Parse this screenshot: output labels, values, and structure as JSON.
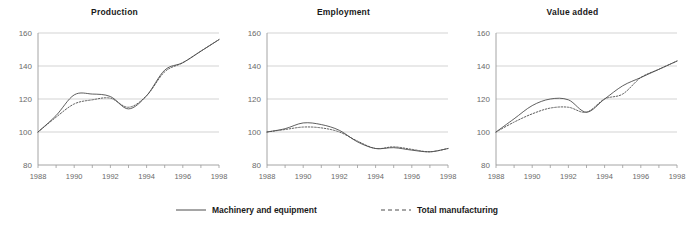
{
  "chart_data": [
    {
      "type": "line",
      "title": "Production",
      "xlabel": "",
      "ylabel": "",
      "x": [
        1988,
        1989,
        1990,
        1991,
        1992,
        1993,
        1994,
        1995,
        1996,
        1997,
        1998
      ],
      "xlim": [
        1988,
        1998
      ],
      "ylim": [
        80,
        160
      ],
      "yticks": [
        80,
        100,
        120,
        140,
        160
      ],
      "xticks": [
        1988,
        1990,
        1992,
        1994,
        1996,
        1998
      ],
      "grid": true,
      "legend_position": "bottom",
      "series": [
        {
          "name": "Machinery and equipment",
          "style": "solid",
          "values": [
            100,
            110,
            122.5,
            123,
            121.5,
            114,
            122,
            137.5,
            142,
            149,
            156
          ]
        },
        {
          "name": "Total manufacturing",
          "style": "dashed",
          "values": [
            100,
            109,
            117,
            119.5,
            120.5,
            115,
            122,
            136.5,
            142,
            149,
            156
          ]
        }
      ]
    },
    {
      "type": "line",
      "title": "Employment",
      "xlabel": "",
      "ylabel": "",
      "x": [
        1988,
        1989,
        1990,
        1991,
        1992,
        1993,
        1994,
        1995,
        1996,
        1997,
        1998
      ],
      "xlim": [
        1988,
        1998
      ],
      "ylim": [
        80,
        160
      ],
      "yticks": [
        80,
        100,
        120,
        140,
        160
      ],
      "xticks": [
        1988,
        1990,
        1992,
        1994,
        1996,
        1998
      ],
      "grid": true,
      "legend_position": "bottom",
      "series": [
        {
          "name": "Machinery and equipment",
          "style": "solid",
          "values": [
            100,
            102,
            105.5,
            104.5,
            101,
            94,
            90,
            90.5,
            89,
            88,
            90
          ]
        },
        {
          "name": "Total manufacturing",
          "style": "dashed",
          "values": [
            100,
            101.5,
            103,
            102.5,
            100,
            94.5,
            90,
            91,
            89.5,
            88,
            90
          ]
        }
      ]
    },
    {
      "type": "line",
      "title": "Value added",
      "xlabel": "",
      "ylabel": "",
      "x": [
        1988,
        1989,
        1990,
        1991,
        1992,
        1993,
        1994,
        1995,
        1996,
        1997,
        1998
      ],
      "xlim": [
        1988,
        1998
      ],
      "ylim": [
        80,
        160
      ],
      "yticks": [
        80,
        100,
        120,
        140,
        160
      ],
      "xticks": [
        1988,
        1990,
        1992,
        1994,
        1996,
        1998
      ],
      "grid": true,
      "legend_position": "bottom",
      "series": [
        {
          "name": "Machinery and equipment",
          "style": "solid",
          "values": [
            100,
            108,
            116,
            120,
            119.5,
            112,
            120,
            128,
            133,
            138,
            143
          ]
        },
        {
          "name": "Total manufacturing",
          "style": "dashed",
          "values": [
            100,
            106,
            111,
            114.5,
            115,
            112,
            120,
            123,
            133,
            138,
            143
          ]
        }
      ]
    }
  ],
  "panels": [
    {
      "title": "Production"
    },
    {
      "title": "Employment"
    },
    {
      "title": "Value added"
    }
  ],
  "legend": {
    "machinery": {
      "label": "Machinery and equipment",
      "style": "solid"
    },
    "total": {
      "label": "Total manufacturing",
      "style": "dashed"
    }
  },
  "colors": {
    "line": "#4d4d4d",
    "grid": "#c8c8c8",
    "axis": "#9a9a9a",
    "tick_text": "#6a6a6a",
    "title_text": "#1a1a1a",
    "background": "#ffffff"
  }
}
